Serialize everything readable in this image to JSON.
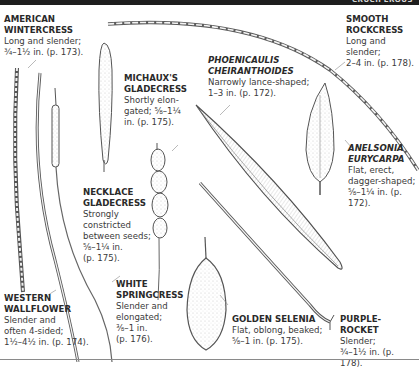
{
  "header": {
    "title": "CRUCIFEROUS"
  },
  "species": [
    {
      "name_lines": [
        "AMERICAN",
        "WINTERCRESS"
      ],
      "italic": false,
      "desc_lines": [
        "Long and slender;",
        "¾–1½ in. (p. 173)."
      ]
    },
    {
      "name_lines": [
        "MICHAUX'S",
        "GLADECRESS"
      ],
      "italic": false,
      "desc_lines": [
        "Shortly elon-",
        "gated; ⅝–1¼",
        "in. (p. 175)."
      ]
    },
    {
      "name_lines": [
        "PHOENICAULIS",
        "CHEIRANTHOIDES"
      ],
      "italic": true,
      "desc_lines": [
        "Narrowly lance-shaped;",
        "1–3 in. (p. 172)."
      ]
    },
    {
      "name_lines": [
        "SMOOTH",
        "ROCKCRESS"
      ],
      "italic": false,
      "desc_lines": [
        "Long and slender;",
        "2–4 in. (p. 178)."
      ]
    },
    {
      "name_lines": [
        "ANELSONIA",
        "EURYCARPA"
      ],
      "italic": true,
      "desc_lines": [
        "Flat, erect,",
        "dagger-shaped;",
        "⅝–1¼ in. (p. 172)."
      ]
    },
    {
      "name_lines": [
        "NECKLACE",
        "GLADECRESS"
      ],
      "italic": false,
      "desc_lines": [
        "Strongly",
        "constricted",
        "between seeds;",
        "⅝–1¼ in.",
        "(p. 175)."
      ]
    },
    {
      "name_lines": [
        "WESTERN",
        "WALLFLOWER"
      ],
      "italic": false,
      "desc_lines": [
        "Slender and",
        "often 4-sided;",
        "1½–4½ in. (p. 174)."
      ]
    },
    {
      "name_lines": [
        "WHITE",
        "SPRINGCRESS"
      ],
      "italic": false,
      "desc_lines": [
        "Slender and",
        "elongated;",
        "⅜–1 in.",
        "(p. 176)."
      ]
    },
    {
      "name_lines": [
        "GOLDEN SELENIA"
      ],
      "italic": false,
      "desc_lines": [
        "Flat, oblong, beaked;",
        "⅝–1 in. (p. 175)."
      ]
    },
    {
      "name_lines": [
        "PURPLE-ROCKET"
      ],
      "italic": false,
      "desc_lines": [
        "Slender;",
        "¾–1½ in. (p. 178)."
      ]
    }
  ]
}
